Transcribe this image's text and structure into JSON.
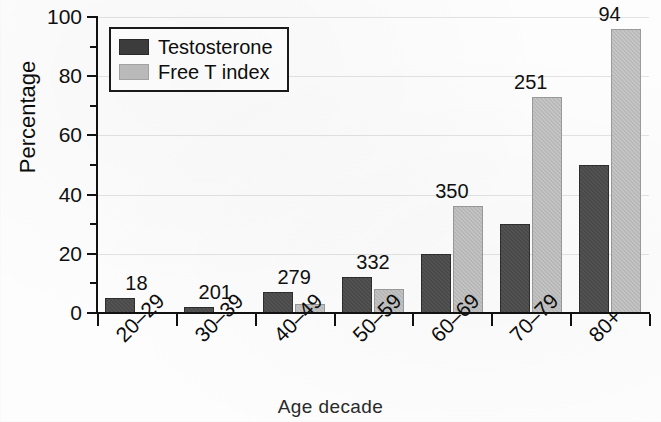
{
  "chart_data": {
    "type": "bar",
    "title": "",
    "xlabel": "Age decade",
    "ylabel": "Percentage",
    "categories": [
      "20–29",
      "30–39",
      "40–49",
      "50–59",
      "60–69",
      "70–79",
      "80+"
    ],
    "series": [
      {
        "name": "Testosterone",
        "color": "#4a4a4a",
        "values": [
          5,
          2,
          7,
          12,
          20,
          30,
          50
        ]
      },
      {
        "name": "Free T index",
        "color": "#b9b9b9",
        "values": [
          0,
          0,
          3,
          8,
          36,
          73,
          96
        ]
      }
    ],
    "group_labels": [
      "18",
      "201",
      "279",
      "332",
      "350",
      "251",
      "94"
    ],
    "ylim": [
      0,
      100
    ],
    "yticks": [
      0,
      20,
      40,
      60,
      80,
      100
    ],
    "ytick_labels": [
      "0",
      "20",
      "40",
      "60",
      "80",
      "100"
    ],
    "yminor_ticks": [
      10,
      30,
      50,
      70,
      90
    ],
    "grid": true,
    "legend_position": "top-left"
  },
  "legend": {
    "entries": [
      {
        "label": "Testosterone",
        "swatch": "dark"
      },
      {
        "label": "Free T index",
        "swatch": "light"
      }
    ]
  }
}
